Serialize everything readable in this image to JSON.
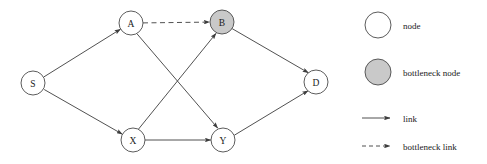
{
  "diagram": {
    "colors": {
      "node_fill": "#ffffff",
      "bottleneck_fill": "#c9c9c9",
      "stroke": "#3d3d3d",
      "label": "#1a1a1a",
      "background": "#ffffff"
    },
    "node_radius": 12,
    "nodes": [
      {
        "id": "S",
        "label": "S",
        "x": 33,
        "y": 83,
        "type": "node"
      },
      {
        "id": "A",
        "label": "A",
        "x": 131,
        "y": 23,
        "type": "node"
      },
      {
        "id": "B",
        "label": "B",
        "x": 222,
        "y": 22,
        "type": "bottleneck node"
      },
      {
        "id": "X",
        "label": "X",
        "x": 133,
        "y": 140,
        "type": "node"
      },
      {
        "id": "Y",
        "label": "Y",
        "x": 223,
        "y": 140,
        "type": "node"
      },
      {
        "id": "D",
        "label": "D",
        "x": 316,
        "y": 82,
        "type": "node"
      }
    ],
    "edges": [
      {
        "from": "S",
        "to": "A",
        "type": "link"
      },
      {
        "from": "S",
        "to": "X",
        "type": "link"
      },
      {
        "from": "A",
        "to": "B",
        "type": "bottleneck link"
      },
      {
        "from": "A",
        "to": "Y",
        "type": "link"
      },
      {
        "from": "X",
        "to": "B",
        "type": "link"
      },
      {
        "from": "X",
        "to": "Y",
        "type": "link"
      },
      {
        "from": "B",
        "to": "D",
        "type": "link"
      },
      {
        "from": "Y",
        "to": "D",
        "type": "link"
      }
    ]
  },
  "legend": {
    "items": [
      {
        "key": "node",
        "label": "node",
        "swatch": "circle-white",
        "cx": 378,
        "cy": 25,
        "r": 13,
        "text_x": 403,
        "text_y": 25
      },
      {
        "key": "bottleneck-node",
        "label": "bottleneck node",
        "swatch": "circle-gray",
        "cx": 378,
        "cy": 72,
        "r": 13,
        "text_x": 403,
        "text_y": 72
      },
      {
        "key": "link",
        "label": "link",
        "swatch": "arrow-solid",
        "x1": 362,
        "x2": 392,
        "y": 118,
        "text_x": 403,
        "text_y": 118
      },
      {
        "key": "bottleneck-link",
        "label": "bottleneck link",
        "swatch": "arrow-dashed",
        "x1": 362,
        "x2": 392,
        "y": 146,
        "text_x": 403,
        "text_y": 146
      }
    ]
  }
}
